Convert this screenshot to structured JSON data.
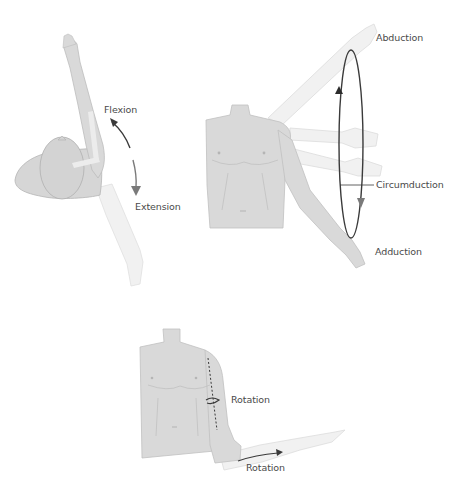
{
  "figure": {
    "panels": [
      {
        "id": "flexion-extension",
        "labels": {
          "up": "Flexion",
          "down": "Extension"
        }
      },
      {
        "id": "abduction-adduction-circumduction",
        "labels": {
          "top": "Abduction",
          "middle": "Circumduction",
          "bottom": "Adduction"
        }
      },
      {
        "id": "rotation",
        "labels": {
          "arm": "Rotation",
          "forearm": "Rotation"
        }
      }
    ],
    "colors": {
      "body": "#d9d9d9",
      "body_outline": "#bdbdbd",
      "faded_limb": "#efefef",
      "arrow_dark": "#3a3a3a",
      "arrow_grey": "#7a7a7a",
      "text": "#4a4a4a"
    }
  }
}
